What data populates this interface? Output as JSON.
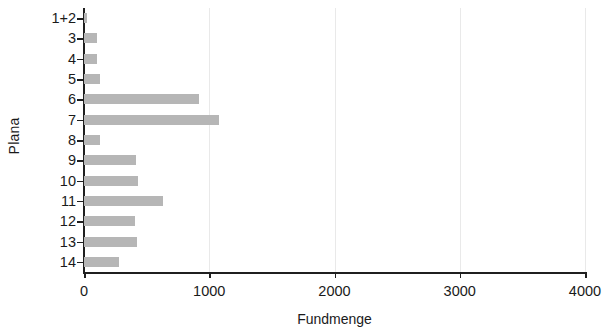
{
  "chart_data": {
    "type": "bar",
    "orientation": "horizontal",
    "title": "",
    "xlabel": "Fundmenge",
    "ylabel": "Plana",
    "categories": [
      "1+2",
      "3",
      "4",
      "5",
      "6",
      "7",
      "8",
      "9",
      "10",
      "11",
      "12",
      "13",
      "14"
    ],
    "values": [
      20,
      105,
      100,
      125,
      920,
      1080,
      130,
      415,
      430,
      630,
      405,
      420,
      280
    ],
    "xlim": [
      0,
      4000
    ],
    "xticks": [
      0,
      1000,
      2000,
      3000,
      4000
    ],
    "xtick_labels": [
      "0",
      "1000",
      "2000",
      "3000",
      "4000"
    ],
    "grid": true,
    "grid_axis": "x",
    "legend": null,
    "bar_color": "#b6b6b6",
    "axis_color": "#1f1f1f",
    "grid_color": "#e9e9e9",
    "background": "#ffffff"
  }
}
